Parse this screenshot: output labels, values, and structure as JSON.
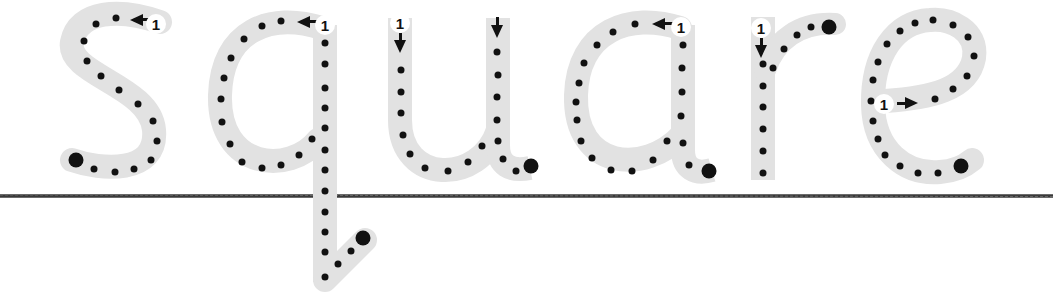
{
  "worksheet": {
    "word": "square",
    "stroke_color": "#e2e2e2",
    "dot_color": "#111111",
    "baseline_color": "#333333",
    "letters": [
      {
        "char": "s",
        "start_label": "1",
        "arrow": "left"
      },
      {
        "char": "q",
        "start_label": "1",
        "arrow": "left"
      },
      {
        "char": "u",
        "start_label": "1",
        "arrow": "down"
      },
      {
        "char": "a",
        "start_label": "1",
        "arrow": "left"
      },
      {
        "char": "r",
        "start_label": "1",
        "arrow": "down"
      },
      {
        "char": "e",
        "start_label": "1",
        "arrow": "right"
      }
    ]
  }
}
